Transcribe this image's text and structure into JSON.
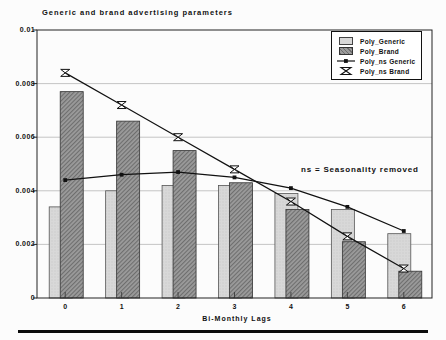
{
  "header": {
    "title": "Generic and brand advertising parameters"
  },
  "chart_data": {
    "type": "bar+line combo",
    "title": "Generic and brand advertising parameters",
    "xlabel": "Bi-Monthly Lags",
    "ylabel": "",
    "annotation": "ns = Seasonality removed",
    "categories": [
      "0",
      "1",
      "2",
      "3",
      "4",
      "5",
      "6"
    ],
    "ylim": [
      0,
      0.01
    ],
    "yticks": {
      "labels": [
        "0.01",
        "0.008",
        "0.006",
        "0.004",
        "0.002",
        "0"
      ],
      "values": [
        0.01,
        0.008,
        0.006,
        0.004,
        0.002,
        0
      ]
    },
    "grid": "horizontal",
    "legend_position": "top-right-inside",
    "series": [
      {
        "name": "Poly_Generic",
        "type": "bar",
        "style": "light-dotted",
        "values": [
          0.0034,
          0.004,
          0.0042,
          0.0042,
          0.0039,
          0.0033,
          0.0024
        ]
      },
      {
        "name": "Poly_Brand",
        "type": "bar",
        "style": "dark-hatched",
        "values": [
          0.0077,
          0.0066,
          0.0055,
          0.0043,
          0.0033,
          0.0021,
          0.001
        ]
      },
      {
        "name": "Poly_ns Generic",
        "type": "line",
        "marker": "square",
        "values": [
          0.0044,
          0.0046,
          0.0047,
          0.0045,
          0.0041,
          0.0034,
          0.0025
        ]
      },
      {
        "name": "Poly_ns Brand",
        "type": "line",
        "marker": "hourglass",
        "values": [
          0.0084,
          0.0072,
          0.006,
          0.0048,
          0.0036,
          0.0023,
          0.0011
        ]
      }
    ]
  },
  "legend": {
    "items": [
      {
        "label": "Poly_Generic",
        "swatch": "bar-light"
      },
      {
        "label": "Poly_Brand",
        "swatch": "bar-dark"
      },
      {
        "label": "Poly_ns Generic",
        "swatch": "line-square"
      },
      {
        "label": "Poly_ns Brand",
        "swatch": "line-hourglass"
      }
    ]
  },
  "colors": {
    "background": "#fcfcfc",
    "bar_light_fill": "#d8d8d8",
    "bar_light_stroke": "#555555",
    "bar_dark_fill": "#9b9b9b",
    "bar_dark_hatch": "#6e6e6e",
    "bar_dark_stroke": "#333333",
    "line": "#111111",
    "gridline": "#bdbdbd",
    "frame": "#222222",
    "text": "#111111",
    "bottom_rule": "#0c0c0c"
  }
}
